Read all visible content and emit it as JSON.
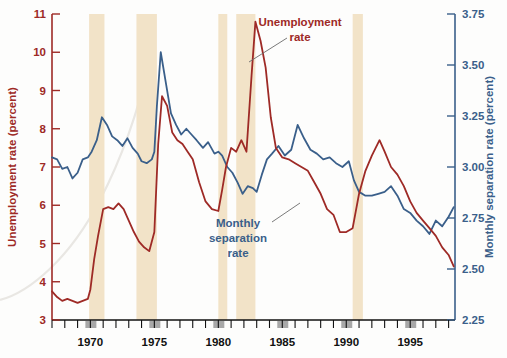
{
  "chart_data": {
    "type": "line",
    "title": "",
    "xlabel": "",
    "grid": false,
    "legend_position": "inline-annotations",
    "xlim": [
      1967.0,
      1998.5
    ],
    "x_ticks": [
      "1970",
      "1975",
      "1980",
      "1985",
      "1990",
      "1995"
    ],
    "x_tick_values": [
      1970,
      1975,
      1980,
      1985,
      1990,
      1995
    ],
    "x_minor_tick_interval": 1,
    "axes": [
      {
        "id": "left",
        "label": "Unemployment rate (percent)",
        "color": "#9e2a26",
        "ylim": [
          3,
          11
        ],
        "ticks": [
          "3",
          "4",
          "5",
          "6",
          "7",
          "8",
          "9",
          "10",
          "11"
        ],
        "tick_values": [
          3,
          4,
          5,
          6,
          7,
          8,
          9,
          10,
          11
        ]
      },
      {
        "id": "right",
        "label": "Monthly separation rate (percent)",
        "color": "#3a5f8a",
        "ylim": [
          2.25,
          3.75
        ],
        "ticks": [
          "2.25",
          "2.50",
          "2.75",
          "3.00",
          "3.25",
          "3.50",
          "3.75"
        ],
        "tick_values": [
          2.25,
          2.5,
          2.75,
          3.0,
          3.25,
          3.5,
          3.75
        ]
      }
    ],
    "recession_bands": {
      "color": "#f2e3c8",
      "label": "recession-band",
      "spans": [
        [
          1969.9,
          1971.1
        ],
        [
          1973.6,
          1975.2
        ],
        [
          1980.0,
          1980.7
        ],
        [
          1981.4,
          1982.9
        ],
        [
          1990.5,
          1991.3
        ]
      ]
    },
    "series": [
      {
        "name": "Unemployment rate",
        "axis": "left",
        "color": "#9e2a26",
        "annotation": {
          "text_lines": [
            "Unemployment",
            "rate"
          ],
          "x": 1982.4,
          "y": 10.55
        },
        "x": [
          1967.0,
          1967.4,
          1967.8,
          1968.2,
          1968.6,
          1969.0,
          1969.4,
          1969.8,
          1970.0,
          1970.3,
          1970.6,
          1971.0,
          1971.4,
          1971.8,
          1972.2,
          1972.6,
          1973.0,
          1973.4,
          1973.8,
          1974.2,
          1974.6,
          1975.0,
          1975.3,
          1975.6,
          1976.0,
          1976.4,
          1976.8,
          1977.2,
          1977.6,
          1978.0,
          1978.5,
          1979.0,
          1979.5,
          1980.0,
          1980.3,
          1980.6,
          1981.0,
          1981.4,
          1981.8,
          1982.2,
          1982.6,
          1982.9,
          1983.3,
          1983.7,
          1984.1,
          1984.5,
          1985.0,
          1985.5,
          1986.0,
          1986.5,
          1987.0,
          1987.5,
          1988.0,
          1988.5,
          1989.0,
          1989.5,
          1990.0,
          1990.5,
          1991.0,
          1991.5,
          1992.0,
          1992.6,
          1993.0,
          1993.5,
          1994.0,
          1994.5,
          1995.0,
          1995.5,
          1996.0,
          1996.5,
          1997.0,
          1997.5,
          1998.0,
          1998.4
        ],
        "y": [
          3.75,
          3.6,
          3.5,
          3.55,
          3.5,
          3.45,
          3.5,
          3.55,
          3.8,
          4.6,
          5.2,
          5.9,
          5.95,
          5.9,
          6.05,
          5.9,
          5.6,
          5.3,
          5.05,
          4.9,
          4.8,
          5.3,
          7.6,
          8.85,
          8.6,
          7.9,
          7.7,
          7.6,
          7.4,
          7.2,
          6.6,
          6.1,
          5.9,
          5.85,
          6.4,
          7.0,
          7.5,
          7.4,
          7.7,
          7.4,
          9.4,
          10.8,
          10.3,
          9.6,
          8.3,
          7.5,
          7.25,
          7.2,
          7.1,
          7.0,
          6.9,
          6.6,
          6.3,
          5.9,
          5.75,
          5.3,
          5.3,
          5.4,
          6.3,
          6.9,
          7.3,
          7.7,
          7.4,
          7.0,
          6.8,
          6.5,
          6.1,
          5.8,
          5.6,
          5.4,
          5.2,
          4.9,
          4.7,
          4.4
        ]
      },
      {
        "name": "Monthly separation rate",
        "axis": "right",
        "color": "#3a5f8a",
        "annotation": {
          "text_lines": [
            "Monthly",
            "separation",
            "rate"
          ],
          "x": 1985.2,
          "y_right": 2.68
        },
        "x": [
          1967.0,
          1967.4,
          1967.8,
          1968.2,
          1968.6,
          1969.0,
          1969.4,
          1969.8,
          1970.1,
          1970.5,
          1970.9,
          1971.3,
          1971.7,
          1972.1,
          1972.5,
          1972.9,
          1973.3,
          1973.7,
          1974.0,
          1974.4,
          1974.8,
          1975.0,
          1975.2,
          1975.5,
          1975.9,
          1976.3,
          1976.7,
          1977.1,
          1977.5,
          1977.9,
          1978.3,
          1978.8,
          1979.2,
          1979.7,
          1980.0,
          1980.3,
          1980.7,
          1981.1,
          1981.5,
          1981.9,
          1982.3,
          1982.7,
          1983.0,
          1983.4,
          1983.8,
          1984.2,
          1984.7,
          1985.2,
          1985.7,
          1986.2,
          1986.7,
          1987.2,
          1987.7,
          1988.2,
          1988.7,
          1989.2,
          1989.7,
          1990.2,
          1990.6,
          1991.0,
          1991.5,
          1992.0,
          1992.5,
          1993.0,
          1993.5,
          1994.0,
          1994.5,
          1995.0,
          1995.5,
          1996.0,
          1996.5,
          1997.0,
          1997.5,
          1998.0,
          1998.4
        ],
        "y_left_scale": [
          7.25,
          7.2,
          6.95,
          7.0,
          6.7,
          6.85,
          7.2,
          7.25,
          7.4,
          7.7,
          8.3,
          8.1,
          7.8,
          7.7,
          7.55,
          7.75,
          7.5,
          7.35,
          7.15,
          7.1,
          7.2,
          7.4,
          8.6,
          10.0,
          9.2,
          8.4,
          8.1,
          7.85,
          8.0,
          7.85,
          7.7,
          7.5,
          7.65,
          7.35,
          7.4,
          7.3,
          7.0,
          6.85,
          6.6,
          6.3,
          6.5,
          6.45,
          6.35,
          6.8,
          7.2,
          7.35,
          7.55,
          7.3,
          7.45,
          8.1,
          7.75,
          7.45,
          7.35,
          7.2,
          7.25,
          7.1,
          7.0,
          7.15,
          6.65,
          6.35,
          6.25,
          6.25,
          6.3,
          6.35,
          6.5,
          6.25,
          5.9,
          5.8,
          5.6,
          5.45,
          5.25,
          5.6,
          5.45,
          5.7,
          5.95
        ],
        "note": "y values expressed on the left (0-11) pixel scale for drawing; right-axis value = 2.25 + (y_left - 3) * 0.1875"
      }
    ]
  },
  "annotations": {
    "unemployment_label_line1": "Unemployment",
    "unemployment_label_line2": "rate",
    "separation_label_line1": "Monthly",
    "separation_label_line2": "separation",
    "separation_label_line3": "rate"
  },
  "axis_titles": {
    "left": "Unemployment rate (percent)",
    "right": "Monthly separation rate (percent)"
  },
  "colors": {
    "unemployment": "#9e2a26",
    "separation": "#3a5f8a",
    "recession_band": "#f2e3c8",
    "background": "#fdfdfc",
    "tick_black": "#111111"
  }
}
